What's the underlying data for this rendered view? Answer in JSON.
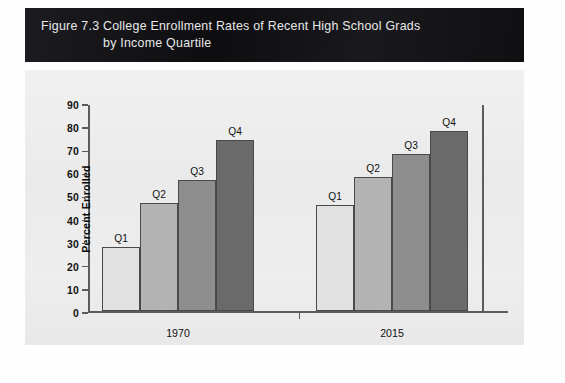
{
  "figure": {
    "number": "Figure 7.3",
    "title_line1": "College Enrollment Rates of Recent High School Grads",
    "title_line2": "by Income Quartile",
    "banner_color": "#16161a",
    "banner_text_color": "#e9e9ea",
    "panel_color": "#eeeeee"
  },
  "chart_data": {
    "type": "bar",
    "title": "College Enrollment Rates of Recent High School Grads by Income Quartile",
    "xlabel": "",
    "ylabel": "Percent Enrolled",
    "ylim": [
      0,
      90
    ],
    "ytick_step": 10,
    "yticks": [
      "90",
      "80",
      "70",
      "60",
      "50",
      "40",
      "30",
      "20",
      "10",
      "0"
    ],
    "grid": false,
    "legend": "none",
    "bar_labels_shown": true,
    "categories": [
      "1970",
      "2015"
    ],
    "series": [
      {
        "name": "Q1",
        "values": [
          28,
          46
        ],
        "color": "#e2e2e2"
      },
      {
        "name": "Q2",
        "values": [
          47,
          58
        ],
        "color": "#b4b4b4"
      },
      {
        "name": "Q3",
        "values": [
          57,
          68
        ],
        "color": "#8e8e8e"
      },
      {
        "name": "Q4",
        "values": [
          74,
          78
        ],
        "color": "#6b6b6b"
      }
    ],
    "bars": [
      {
        "group": "1970",
        "label": "Q1",
        "value": 28,
        "color": "#e2e2e2"
      },
      {
        "group": "1970",
        "label": "Q2",
        "value": 47,
        "color": "#b4b4b4"
      },
      {
        "group": "1970",
        "label": "Q3",
        "value": 57,
        "color": "#8e8e8e"
      },
      {
        "group": "1970",
        "label": "Q4",
        "value": 74,
        "color": "#6b6b6b"
      },
      {
        "group": "2015",
        "label": "Q1",
        "value": 46,
        "color": "#e2e2e2"
      },
      {
        "group": "2015",
        "label": "Q2",
        "value": 58,
        "color": "#b4b4b4"
      },
      {
        "group": "2015",
        "label": "Q3",
        "value": 68,
        "color": "#8e8e8e"
      },
      {
        "group": "2015",
        "label": "Q4",
        "value": 78,
        "color": "#6b6b6b"
      }
    ],
    "group_labels": [
      "1970",
      "2015"
    ]
  }
}
